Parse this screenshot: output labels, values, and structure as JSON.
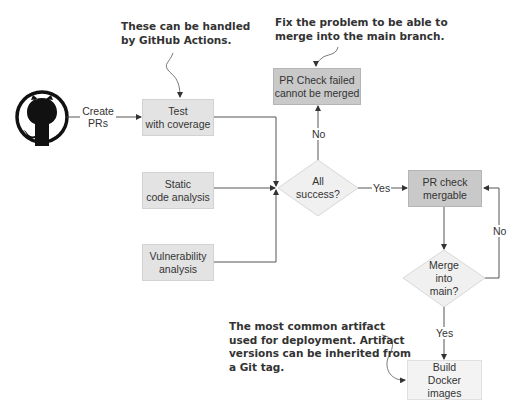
{
  "diagram": {
    "start": {
      "icon": "github-icon",
      "edge_label_line1": "Create",
      "edge_label_line2": "PRs"
    },
    "checks": [
      {
        "line1": "Test",
        "line2": "with coverage"
      },
      {
        "line1": "Static",
        "line2": "code analysis"
      },
      {
        "line1": "Vulnerability",
        "line2": "analysis"
      }
    ],
    "decision_all": {
      "line1": "All",
      "line2": "success?"
    },
    "failed": {
      "line1": "PR Check failed",
      "line2": "cannot be merged"
    },
    "mergable": {
      "line1": "PR check",
      "line2": "mergable"
    },
    "decision_merge": {
      "line1": "Merge",
      "line2": "into",
      "line3": "main?"
    },
    "build": {
      "line1": "Build",
      "line2": "Docker",
      "line3": "images"
    },
    "edge_labels": {
      "all_no": "No",
      "all_yes": "Yes",
      "merge_no": "No",
      "merge_yes": "Yes"
    },
    "annotations": {
      "actions": {
        "line1": "These can be handled",
        "line2": "by GitHub Actions."
      },
      "fix": {
        "line1": "Fix the problem to be able to",
        "line2": "merge into the main branch."
      },
      "artifact": {
        "line1": "The most common artifact",
        "line2": "used for deployment. Artifact",
        "line3": "versions can be inherited from",
        "line4": "a Git tag."
      }
    },
    "colors": {
      "light_box": "#e3e3e3",
      "dark_box": "#c9c9c9",
      "lightest_box": "#f3f3f3",
      "line": "#555555",
      "diamond": "#f0f0f0"
    }
  }
}
